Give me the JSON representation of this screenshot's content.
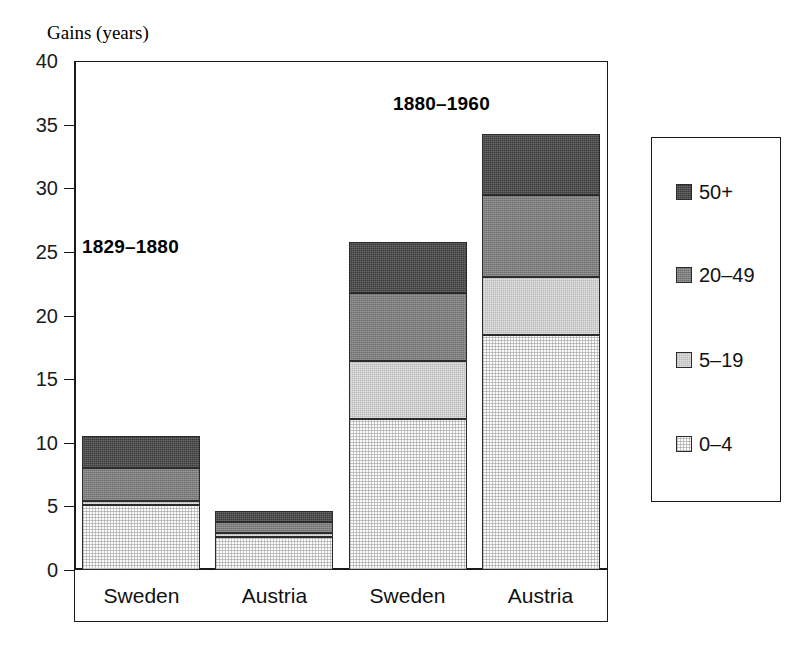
{
  "chart_data": {
    "type": "bar",
    "title": "",
    "subtitle": "",
    "xlabel": "",
    "ylabel": "Gains (years)",
    "ylim": [
      0,
      40
    ],
    "ytick_values": [
      0,
      5,
      10,
      15,
      20,
      25,
      30,
      35,
      40
    ],
    "ytick_labels": [
      "0",
      "5",
      "10",
      "15",
      "20",
      "25",
      "30",
      "35",
      "40"
    ],
    "grid": false,
    "stacked": true,
    "legend_position": "right",
    "categories": [
      "Sweden",
      "Austria",
      "Sweden",
      "Austria"
    ],
    "series": [
      {
        "name": "0-4",
        "values": [
          5.1,
          2.6,
          11.9,
          18.5
        ]
      },
      {
        "name": "5-19",
        "values": [
          0.3,
          0.3,
          4.5,
          4.5
        ]
      },
      {
        "name": "20-49",
        "values": [
          2.6,
          0.9,
          5.4,
          6.5
        ]
      },
      {
        "name": "50+",
        "values": [
          2.5,
          0.8,
          4.0,
          4.8
        ]
      }
    ],
    "totals": [
      10.5,
      4.6,
      25.8,
      34.3
    ],
    "annotations": [
      {
        "text": "1829–1880",
        "x_px": 82,
        "y_px": 236
      },
      {
        "text": "1880–1960",
        "x_px": 393,
        "y_px": 93
      }
    ],
    "legend_entries": [
      {
        "label": "50+",
        "color": "#3a3a3a",
        "pattern": "dense-dither"
      },
      {
        "label": "20–49",
        "color": "#6e6e6e",
        "pattern": "medium-dither"
      },
      {
        "label": "5–19",
        "color": "#cfcfcf",
        "pattern": "light-dither"
      },
      {
        "label": "0–4",
        "color": "#fbfbfb",
        "pattern": "dot-grid"
      }
    ]
  },
  "axis": {
    "y_title": "Gains (years)"
  },
  "colors": {
    "axis": "#1a1a1a",
    "text": "#111111",
    "band_50_plus": "#3a3a3a",
    "band_20_49": "#6e6e6e",
    "band_5_19": "#cfcfcf",
    "band_0_4": "#fbfbfb"
  }
}
